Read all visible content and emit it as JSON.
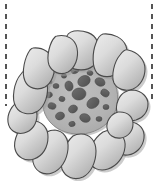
{
  "figure": {
    "canvas": {
      "width": 160,
      "height": 189,
      "background": "#ffffff"
    }
  },
  "colors": {
    "background": "#ffffff",
    "cell_fill_light": "#e2e2e2",
    "cell_fill_dark": "#b4b4b4",
    "cell_outline": "#4a4a4a",
    "matrix_fill": "#b2b2b2",
    "matrix_outline": "#8c8c8c",
    "inclusion_fill": "#5e5e5e",
    "inclusion_outline": "#474747",
    "guide_line": "#2b2b2b",
    "shadow": "#9a9a9a"
  },
  "guide_lines": [
    {
      "name": "left-dashed-line",
      "x": 6,
      "y1": 4,
      "y2": 106,
      "dash": "5 5",
      "width": 1.6
    },
    {
      "name": "right-dashed-line",
      "x": 152,
      "y1": 4,
      "y2": 101,
      "dash": "5 5",
      "width": 1.6
    }
  ],
  "matrix": {
    "name": "central-matrix",
    "cx": 79,
    "cy": 98,
    "rx": 36,
    "ry": 35,
    "path": "M 79 63 C 93 62 106 68 113 80 C 120 92 119 108 111 119 C 102 130 88 135 76 134 C 62 133 50 126 45 114 C 40 102 42 87 51 77 C 58 68 68 63 79 63 Z"
  },
  "inclusions": [
    {
      "name": "inclusion-1",
      "cx": 75,
      "cy": 70,
      "rx": 4.2,
      "ry": 3.4,
      "rot": -20
    },
    {
      "name": "inclusion-2",
      "cx": 90,
      "cy": 73,
      "rx": 3.0,
      "ry": 2.4,
      "rot": 15
    },
    {
      "name": "inclusion-3",
      "cx": 64,
      "cy": 76,
      "rx": 2.6,
      "ry": 2.2,
      "rot": 0
    },
    {
      "name": "inclusion-4",
      "cx": 84,
      "cy": 81,
      "rx": 6.5,
      "ry": 5.2,
      "rot": -30
    },
    {
      "name": "inclusion-5",
      "cx": 100,
      "cy": 82,
      "rx": 5.2,
      "ry": 4.0,
      "rot": 25
    },
    {
      "name": "inclusion-6",
      "cx": 69,
      "cy": 86,
      "rx": 4.0,
      "ry": 5.0,
      "rot": -15
    },
    {
      "name": "inclusion-7",
      "cx": 56,
      "cy": 86,
      "rx": 3.0,
      "ry": 2.5,
      "rot": 0
    },
    {
      "name": "inclusion-8",
      "cx": 79,
      "cy": 94,
      "rx": 7.0,
      "ry": 6.0,
      "rot": -10
    },
    {
      "name": "inclusion-9",
      "cx": 105,
      "cy": 93,
      "rx": 4.4,
      "ry": 3.6,
      "rot": 30
    },
    {
      "name": "inclusion-10",
      "cx": 49,
      "cy": 95,
      "rx": 3.4,
      "ry": 2.8,
      "rot": -20
    },
    {
      "name": "inclusion-11",
      "cx": 62,
      "cy": 99,
      "rx": 3.0,
      "ry": 2.6,
      "rot": 10
    },
    {
      "name": "inclusion-12",
      "cx": 93,
      "cy": 103,
      "rx": 6.6,
      "ry": 5.0,
      "rot": -35
    },
    {
      "name": "inclusion-13",
      "cx": 52,
      "cy": 106,
      "rx": 4.0,
      "ry": 3.2,
      "rot": 15
    },
    {
      "name": "inclusion-14",
      "cx": 73,
      "cy": 109,
      "rx": 4.6,
      "ry": 3.8,
      "rot": -25
    },
    {
      "name": "inclusion-15",
      "cx": 106,
      "cy": 107,
      "rx": 3.0,
      "ry": 2.6,
      "rot": 0
    },
    {
      "name": "inclusion-16",
      "cx": 60,
      "cy": 116,
      "rx": 4.6,
      "ry": 3.8,
      "rot": -20
    },
    {
      "name": "inclusion-17",
      "cx": 85,
      "cy": 118,
      "rx": 5.4,
      "ry": 4.2,
      "rot": 20
    },
    {
      "name": "inclusion-18",
      "cx": 99,
      "cy": 119,
      "rx": 3.0,
      "ry": 2.4,
      "rot": 0
    },
    {
      "name": "inclusion-19",
      "cx": 72,
      "cy": 124,
      "rx": 3.2,
      "ry": 2.6,
      "rot": -10
    },
    {
      "name": "inclusion-20",
      "cx": 50,
      "cy": 82,
      "rx": 2.2,
      "ry": 1.9,
      "rot": 0
    },
    {
      "name": "inclusion-21",
      "cx": 89,
      "cy": 64,
      "rx": 2.2,
      "ry": 1.9,
      "rot": 0
    }
  ],
  "cells": [
    {
      "name": "cell-n",
      "label": "outer-cell-north",
      "path": "M 74 31 C 84 30 94 33 97 41 C 100 50 98 61 93 66 C 87 71 76 71 70 67 C 64 62 62 50 65 41 C 67 34 69 32 74 31 Z"
    },
    {
      "name": "cell-nne",
      "label": "outer-cell-north-northeast",
      "path": "M 103 34 C 113 33 123 38 126 46 C 129 55 126 66 119 72 C 112 78 102 78 97 73 C 92 67 92 53 96 43 C 98 37 100 35 103 34 Z"
    },
    {
      "name": "cell-ne",
      "label": "outer-cell-northeast",
      "path": "M 128 50 C 138 52 145 60 145 69 C 145 78 140 86 133 89 C 125 92 117 89 114 83 C 111 76 114 62 120 55 C 123 51 125 49 128 50 Z"
    },
    {
      "name": "cell-ene",
      "label": "outer-cell-east-northeast",
      "path": "M 133 90 C 142 91 148 97 148 104 C 148 112 143 118 136 120 C 128 122 120 118 117 112 C 115 105 119 95 125 92 C 128 90 131 90 133 90 Z"
    },
    {
      "name": "cell-e",
      "label": "outer-cell-east",
      "path": "M 131 122 C 140 123 145 130 144 138 C 143 147 136 154 128 155 C 120 156 113 151 112 144 C 111 136 117 127 124 123 C 127 122 129 122 131 122 Z"
    },
    {
      "name": "cell-se",
      "label": "outer-cell-southeast",
      "path": "M 112 130 C 120 131 126 138 125 147 C 124 157 117 166 108 169 C 99 172 91 168 89 160 C 87 151 94 138 103 132 C 107 130 110 130 112 130 Z"
    },
    {
      "name": "cell-s",
      "label": "outer-cell-south",
      "path": "M 81 134 C 90 134 96 141 96 151 C 96 162 91 173 83 177 C 74 181 65 177 62 169 C 59 159 65 143 73 136 C 76 134 79 134 81 134 Z"
    },
    {
      "name": "cell-ssw",
      "label": "outer-cell-south-southwest",
      "path": "M 55 130 C 64 131 69 139 68 149 C 67 160 61 170 52 173 C 43 176 35 171 33 162 C 31 152 38 138 47 132 C 50 130 53 130 55 130 Z"
    },
    {
      "name": "cell-sw",
      "label": "outer-cell-southwest",
      "path": "M 33 121 C 42 121 48 128 48 137 C 48 147 43 156 34 159 C 25 162 17 157 15 149 C 13 140 19 127 27 122 C 29 121 31 121 33 121 Z"
    },
    {
      "name": "cell-wsw",
      "label": "outer-cell-west-southwest",
      "path": "M 22 101 C 31 101 37 107 37 115 C 37 124 32 131 24 133 C 16 135 9 130 8 122 C 7 114 12 104 19 102 C 20 101 21 101 22 101 Z"
    },
    {
      "name": "cell-w",
      "label": "outer-cell-west",
      "path": "M 27 70 C 37 69 45 75 47 84 C 49 94 45 106 38 111 C 30 116 20 114 16 107 C 11 99 14 82 21 74 C 23 71 25 70 27 70 Z"
    },
    {
      "name": "cell-wnw",
      "label": "outer-cell-west-northwest",
      "path": "M 33 48 C 43 47 52 53 54 62 C 56 72 52 83 45 87 C 37 91 28 88 25 81 C 21 72 25 57 30 50 C 31 49 32 48 33 48 Z"
    },
    {
      "name": "cell-nw",
      "label": "outer-cell-northwest",
      "path": "M 57 36 C 67 34 75 39 77 48 C 79 58 75 68 68 72 C 60 76 52 72 49 65 C 46 56 50 42 55 37 C 56 36 56 36 57 36 Z"
    },
    {
      "name": "cell-ene2",
      "label": "outer-cell-east-upper",
      "path": "M 120 112 C 128 112 133 117 133 124 C 133 131 128 137 121 138 C 114 139 108 135 107 128 C 106 121 111 114 118 112 C 119 112 119 112 120 112 Z"
    }
  ],
  "counts": {
    "outer_cells": 14,
    "inclusions": 21
  }
}
